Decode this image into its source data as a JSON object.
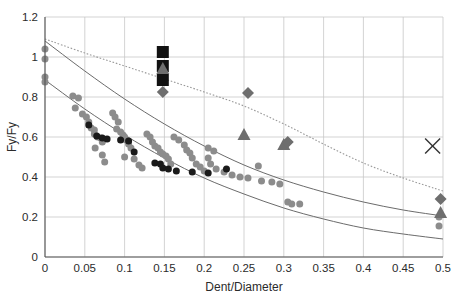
{
  "chart_data": {
    "type": "scatter",
    "title": "",
    "xlabel": "Dent/Diameter",
    "ylabel": "Fy/Fy",
    "xlim": [
      0,
      0.5
    ],
    "ylim": [
      0,
      1.2
    ],
    "grid": true,
    "legend": "none",
    "xticks": [
      "0",
      "0.05",
      "0.1",
      "0.15",
      "0.2",
      "0.25",
      "0.3",
      "0.35",
      "0.4",
      "0.45",
      "0.5"
    ],
    "xtick_values": [
      0,
      0.05,
      0.1,
      0.15,
      0.2,
      0.25,
      0.3,
      0.35,
      0.4,
      0.45,
      0.5
    ],
    "yticks": [
      "0",
      "0.2",
      "0.4",
      "0.6",
      "0.8",
      "1",
      "1.2"
    ],
    "ytick_values": [
      0,
      0.2,
      0.4,
      0.6,
      0.8,
      1.0,
      1.2
    ],
    "colors": {
      "grid": "#c8c8c8",
      "axis": "#555555",
      "marker_dark": "#111111",
      "marker_gray": "#8c8c8c",
      "marker_midgray": "#6e6e6e",
      "curve_solid": "#6b6b6b",
      "curve_dotted": "#9a9a9a",
      "text": "#2b2b2b"
    },
    "series": [
      {
        "name": "gray-circles",
        "marker": "circle",
        "color": "#8c8c8c",
        "size": 7,
        "points": [
          [
            0.0,
            1.04
          ],
          [
            0.0,
            0.99
          ],
          [
            0.0,
            0.9
          ],
          [
            0.0,
            0.875
          ],
          [
            0.035,
            0.805
          ],
          [
            0.042,
            0.795
          ],
          [
            0.038,
            0.745
          ],
          [
            0.047,
            0.715
          ],
          [
            0.052,
            0.7
          ],
          [
            0.055,
            0.675
          ],
          [
            0.058,
            0.645
          ],
          [
            0.062,
            0.635
          ],
          [
            0.062,
            0.615
          ],
          [
            0.066,
            0.6
          ],
          [
            0.07,
            0.595
          ],
          [
            0.072,
            0.575
          ],
          [
            0.063,
            0.545
          ],
          [
            0.072,
            0.51
          ],
          [
            0.075,
            0.475
          ],
          [
            0.085,
            0.72
          ],
          [
            0.088,
            0.7
          ],
          [
            0.092,
            0.675
          ],
          [
            0.09,
            0.64
          ],
          [
            0.095,
            0.625
          ],
          [
            0.098,
            0.61
          ],
          [
            0.1,
            0.6
          ],
          [
            0.102,
            0.585
          ],
          [
            0.105,
            0.565
          ],
          [
            0.108,
            0.545
          ],
          [
            0.1,
            0.5
          ],
          [
            0.112,
            0.49
          ],
          [
            0.118,
            0.46
          ],
          [
            0.122,
            0.445
          ],
          [
            0.128,
            0.615
          ],
          [
            0.132,
            0.6
          ],
          [
            0.135,
            0.575
          ],
          [
            0.138,
            0.555
          ],
          [
            0.142,
            0.545
          ],
          [
            0.145,
            0.525
          ],
          [
            0.148,
            0.515
          ],
          [
            0.152,
            0.505
          ],
          [
            0.155,
            0.49
          ],
          [
            0.158,
            0.465
          ],
          [
            0.162,
            0.6
          ],
          [
            0.168,
            0.585
          ],
          [
            0.175,
            0.56
          ],
          [
            0.178,
            0.535
          ],
          [
            0.182,
            0.52
          ],
          [
            0.185,
            0.495
          ],
          [
            0.19,
            0.465
          ],
          [
            0.195,
            0.45
          ],
          [
            0.2,
            0.43
          ],
          [
            0.205,
            0.545
          ],
          [
            0.212,
            0.53
          ],
          [
            0.205,
            0.495
          ],
          [
            0.208,
            0.465
          ],
          [
            0.215,
            0.44
          ],
          [
            0.225,
            0.425
          ],
          [
            0.235,
            0.41
          ],
          [
            0.245,
            0.4
          ],
          [
            0.255,
            0.395
          ],
          [
            0.268,
            0.455
          ],
          [
            0.272,
            0.38
          ],
          [
            0.285,
            0.375
          ],
          [
            0.295,
            0.365
          ],
          [
            0.305,
            0.275
          ],
          [
            0.31,
            0.265
          ],
          [
            0.32,
            0.265
          ],
          [
            0.495,
            0.2
          ],
          [
            0.495,
            0.155
          ]
        ]
      },
      {
        "name": "dark-circles",
        "marker": "circle",
        "color": "#1a1a1a",
        "size": 7,
        "points": [
          [
            0.055,
            0.66
          ],
          [
            0.065,
            0.605
          ],
          [
            0.072,
            0.595
          ],
          [
            0.078,
            0.59
          ],
          [
            0.095,
            0.585
          ],
          [
            0.105,
            0.58
          ],
          [
            0.112,
            0.525
          ],
          [
            0.138,
            0.47
          ],
          [
            0.145,
            0.465
          ],
          [
            0.148,
            0.445
          ],
          [
            0.155,
            0.44
          ],
          [
            0.165,
            0.43
          ],
          [
            0.185,
            0.425
          ],
          [
            0.205,
            0.42
          ],
          [
            0.228,
            0.44
          ]
        ]
      },
      {
        "name": "black-squares",
        "marker": "square",
        "color": "#111111",
        "size": 12,
        "points": [
          [
            0.148,
            1.025
          ],
          [
            0.148,
            0.955
          ],
          [
            0.148,
            0.885
          ]
        ]
      },
      {
        "name": "gray-triangles",
        "marker": "triangle",
        "color": "#6e6e6e",
        "size": 13,
        "points": [
          [
            0.148,
            0.945
          ],
          [
            0.25,
            0.615
          ],
          [
            0.3,
            0.565
          ],
          [
            0.497,
            0.225
          ]
        ]
      },
      {
        "name": "gray-diamonds",
        "marker": "diamond",
        "color": "#6e6e6e",
        "size": 12,
        "points": [
          [
            0.148,
            0.825
          ],
          [
            0.255,
            0.82
          ],
          [
            0.305,
            0.575
          ],
          [
            0.497,
            0.29
          ]
        ]
      },
      {
        "name": "x-marker",
        "marker": "x",
        "color": "#333333",
        "size": 15,
        "points": [
          [
            0.487,
            0.555
          ]
        ]
      }
    ],
    "curves": [
      {
        "name": "upper-dotted",
        "style": "dotted",
        "color": "#9a9a9a",
        "points": [
          [
            0.0,
            1.09
          ],
          [
            0.05,
            1.02
          ],
          [
            0.1,
            0.955
          ],
          [
            0.15,
            0.89
          ],
          [
            0.2,
            0.825
          ],
          [
            0.25,
            0.755
          ],
          [
            0.3,
            0.665
          ],
          [
            0.35,
            0.565
          ],
          [
            0.4,
            0.47
          ],
          [
            0.45,
            0.395
          ],
          [
            0.5,
            0.33
          ]
        ]
      },
      {
        "name": "middle-solid",
        "style": "solid",
        "color": "#6b6b6b",
        "points": [
          [
            0.0,
            1.08
          ],
          [
            0.05,
            0.93
          ],
          [
            0.1,
            0.79
          ],
          [
            0.15,
            0.665
          ],
          [
            0.2,
            0.555
          ],
          [
            0.25,
            0.46
          ],
          [
            0.3,
            0.385
          ],
          [
            0.35,
            0.325
          ],
          [
            0.4,
            0.275
          ],
          [
            0.45,
            0.235
          ],
          [
            0.5,
            0.205
          ]
        ]
      },
      {
        "name": "lower-solid",
        "style": "solid",
        "color": "#6b6b6b",
        "points": [
          [
            0.0,
            0.885
          ],
          [
            0.05,
            0.74
          ],
          [
            0.1,
            0.61
          ],
          [
            0.15,
            0.495
          ],
          [
            0.2,
            0.395
          ],
          [
            0.25,
            0.315
          ],
          [
            0.3,
            0.245
          ],
          [
            0.35,
            0.19
          ],
          [
            0.4,
            0.145
          ],
          [
            0.45,
            0.115
          ],
          [
            0.5,
            0.09
          ]
        ]
      }
    ]
  }
}
